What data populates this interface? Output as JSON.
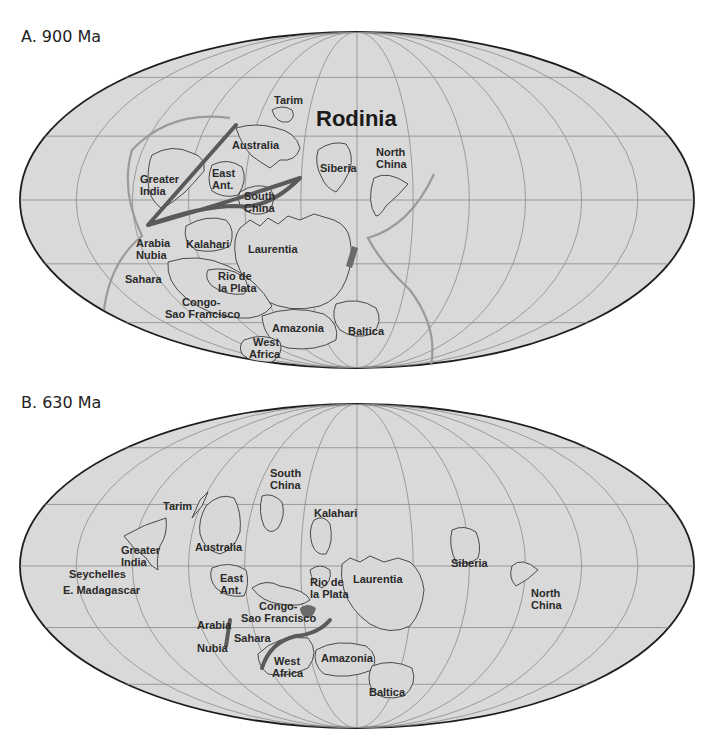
{
  "figure": {
    "panel_a": {
      "title": "A. 900 Ma",
      "supercontinent_label": "Rodinia",
      "labels": {
        "tarim": "Tarim",
        "australia": "Australia",
        "greater_india_1": "Greater",
        "greater_india_2": "India",
        "east_ant_1": "East",
        "east_ant_2": "Ant.",
        "south_china_1": "South",
        "south_china_2": "China",
        "siberia": "Siberia",
        "north_china_1": "North",
        "north_china_2": "China",
        "arabia_nubia_1": "Arabia",
        "arabia_nubia_2": "Nubia",
        "kalahari": "Kalahari",
        "laurentia": "Laurentia",
        "sahara": "Sahara",
        "rio_de_la_plata_1": "Rio de",
        "rio_de_la_plata_2": "la Plata",
        "congo_1": "Congo-",
        "congo_2": "Sao Francisco",
        "amazonia": "Amazonia",
        "baltica": "Baltica",
        "west_africa_1": "West",
        "west_africa_2": "Africa"
      }
    },
    "panel_b": {
      "title": "B. 630 Ma",
      "labels": {
        "south_china_1": "South",
        "south_china_2": "China",
        "tarim": "Tarim",
        "kalahari": "Kalahari",
        "australia": "Australia",
        "greater_india_1": "Greater",
        "greater_india_2": "India",
        "seychelles": "Seychelles",
        "e_madagascar": "E. Madagascar",
        "east_ant_1": "East",
        "east_ant_2": "Ant.",
        "rio_de_la_plata_1": "Rio de",
        "rio_de_la_plata_2": "la Plata",
        "laurentia": "Laurentia",
        "siberia": "Siberia",
        "north_china_1": "North",
        "north_china_2": "China",
        "congo_1": "Congo-",
        "congo_2": "Sao Francisco",
        "arabia": "Arabia",
        "sahara": "Sahara",
        "nubia": "Nubia",
        "west_africa_1": "West",
        "west_africa_2": "Africa",
        "amazonia": "Amazonia",
        "baltica": "Baltica"
      }
    },
    "colors": {
      "ocean": "#d9d9d9",
      "outline": "#1e1e1e",
      "orogen": "#5a5a5a",
      "subduction": "#9a9a9a"
    }
  }
}
